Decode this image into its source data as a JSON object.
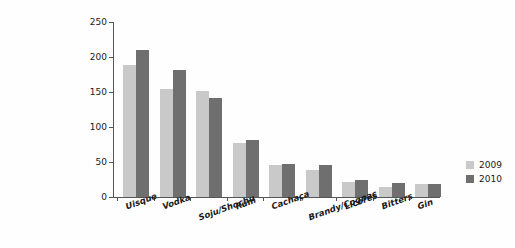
{
  "chart_data": {
    "type": "bar",
    "title": "",
    "xlabel": "",
    "ylabel": "Vendas (milhões de caixas de 9 litros)",
    "ylim": [
      0,
      250
    ],
    "yticks": [
      0,
      50,
      100,
      150,
      200,
      250
    ],
    "grid": false,
    "legend_position": "right",
    "categories": [
      "Uisque",
      "Vodka",
      "Soju/Shochu",
      "Rum",
      "Cachaça",
      "Brandy/Cognac",
      "Licores",
      "Bitters",
      "Gin"
    ],
    "series": [
      {
        "name": "2009",
        "color": "#c9c9c9",
        "values": [
          188,
          155,
          152,
          77,
          46,
          38,
          22,
          15,
          18
        ]
      },
      {
        "name": "2010",
        "color": "#6f6f6f",
        "values": [
          210,
          181,
          141,
          81,
          47,
          46,
          25,
          20,
          18
        ]
      }
    ]
  }
}
